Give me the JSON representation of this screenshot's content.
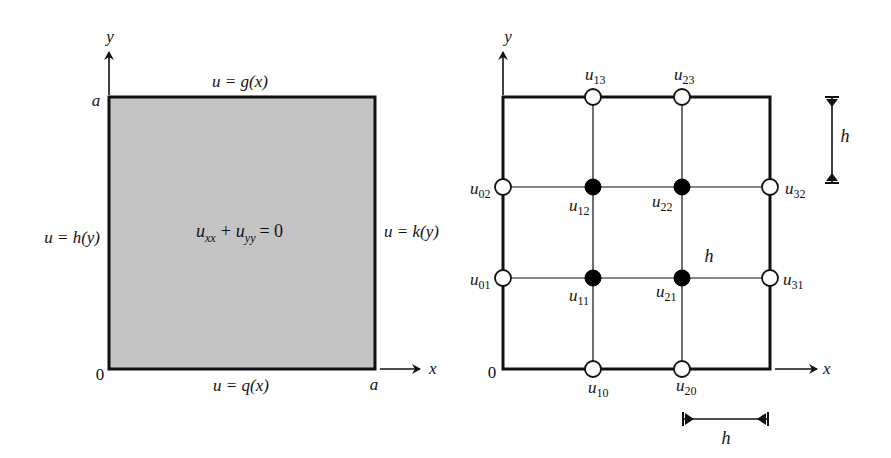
{
  "colors": {
    "ink": "#111111",
    "domain_fill": "#c4c4c4",
    "background": "#ffffff",
    "open_node_fill": "#ffffff",
    "filled_node_fill": "#000000"
  },
  "left_panel": {
    "axis_y_label": "y",
    "axis_x_label": "x",
    "origin_label": "0",
    "top_corner_label": "a",
    "right_corner_label": "a",
    "top_boundary": "u = g(x)",
    "bottom_boundary": "u = q(x)",
    "left_boundary": "u = h(y)",
    "right_boundary": "u = k(y)",
    "equation": {
      "u1": "u",
      "sub1": "xx",
      "plus": "+",
      "u2": "u",
      "sub2": "yy",
      "eq": "= 0"
    }
  },
  "right_panel": {
    "axis_y_label": "y",
    "axis_x_label": "x",
    "origin_label": "0",
    "spacing_vertical_label": "h",
    "spacing_horizontal_label": "h",
    "spacing_interior_label": "h",
    "nodes": [
      {
        "id": "u13",
        "base": "u",
        "sub": "13",
        "type": "boundary"
      },
      {
        "id": "u23",
        "base": "u",
        "sub": "23",
        "type": "boundary"
      },
      {
        "id": "u02",
        "base": "u",
        "sub": "02",
        "type": "boundary"
      },
      {
        "id": "u12",
        "base": "u",
        "sub": "12",
        "type": "interior"
      },
      {
        "id": "u22",
        "base": "u",
        "sub": "22",
        "type": "interior"
      },
      {
        "id": "u32",
        "base": "u",
        "sub": "32",
        "type": "boundary"
      },
      {
        "id": "u01",
        "base": "u",
        "sub": "01",
        "type": "boundary"
      },
      {
        "id": "u11",
        "base": "u",
        "sub": "11",
        "type": "interior"
      },
      {
        "id": "u21",
        "base": "u",
        "sub": "21",
        "type": "interior"
      },
      {
        "id": "u31",
        "base": "u",
        "sub": "31",
        "type": "boundary"
      },
      {
        "id": "u10",
        "base": "u",
        "sub": "10",
        "type": "boundary"
      },
      {
        "id": "u20",
        "base": "u",
        "sub": "20",
        "type": "boundary"
      }
    ]
  }
}
